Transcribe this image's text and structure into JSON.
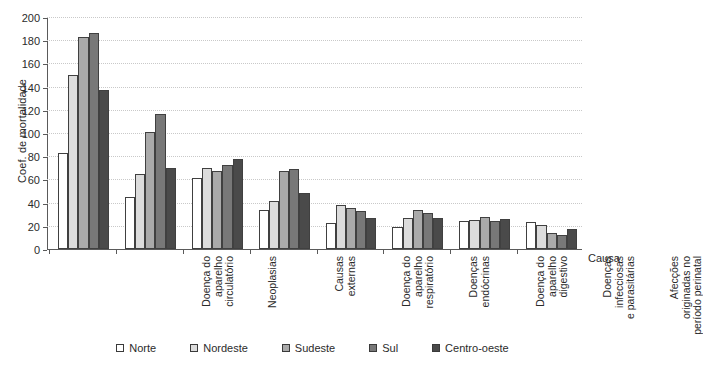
{
  "chart_data": {
    "type": "bar",
    "title": "",
    "xlabel": "Causa",
    "ylabel": "Coef. de mortalidade",
    "ylim": [
      0,
      200
    ],
    "ytick_step": 20,
    "yticks": [
      0,
      20,
      40,
      60,
      80,
      100,
      120,
      140,
      160,
      180,
      200
    ],
    "grid": true,
    "legend_position": "bottom",
    "categories": [
      "Doença do\naparelho\ncirculatório",
      "Neoplasias",
      "Causas\nexternas",
      "Doença do\naparelho\nrespiratório",
      "Doenças\nendócrinas",
      "Doença do\naparelho\ndigestivo",
      "Doenças\ninfecciosas\ne parasitárias",
      "Afecções\noriginadas no\nperíodo perinatal"
    ],
    "series": [
      {
        "name": "Norte",
        "color": "#ffffff",
        "values": [
          83,
          45,
          61,
          34,
          22,
          19,
          24,
          23
        ]
      },
      {
        "name": "Nordeste",
        "color": "#dcdcdc",
        "values": [
          150,
          65,
          70,
          41,
          38,
          27,
          25,
          21
        ]
      },
      {
        "name": "Sudeste",
        "color": "#aaaaaa",
        "values": [
          183,
          101,
          67,
          67,
          35,
          34,
          28,
          14
        ]
      },
      {
        "name": "Sul",
        "color": "#787878",
        "values": [
          186,
          116,
          72,
          69,
          33,
          31,
          24,
          12
        ]
      },
      {
        "name": "Centro-oeste",
        "color": "#4a4a4a",
        "values": [
          137,
          70,
          78,
          48,
          27,
          27,
          26,
          17
        ]
      }
    ]
  }
}
